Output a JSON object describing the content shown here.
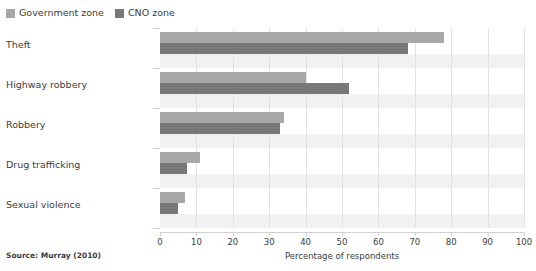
{
  "chart_data": {
    "type": "bar",
    "orientation": "horizontal",
    "title": "",
    "subtitle": "",
    "xlabel": "Percentage of respondents",
    "ylabel": "",
    "xlim": [
      0,
      100
    ],
    "xticks": [
      0,
      10,
      20,
      30,
      40,
      50,
      60,
      70,
      80,
      90,
      100
    ],
    "grid": "vertical",
    "legend_position": "top-left",
    "categories": [
      "Theft",
      "Highway robbery",
      "Robbery",
      "Drug trafficking",
      "Sexual violence"
    ],
    "series": [
      {
        "name": "Government zone",
        "color": "#a8a8a8",
        "values": [
          78,
          40,
          34,
          11,
          7
        ]
      },
      {
        "name": "CNO zone",
        "color": "#787878",
        "values": [
          68,
          52,
          33,
          7.5,
          5
        ]
      }
    ],
    "source": "Source: Murray (2010)"
  },
  "legend": {
    "items": [
      {
        "label": "Government zone",
        "color": "#a8a8a8"
      },
      {
        "label": "CNO zone",
        "color": "#787878"
      }
    ]
  }
}
